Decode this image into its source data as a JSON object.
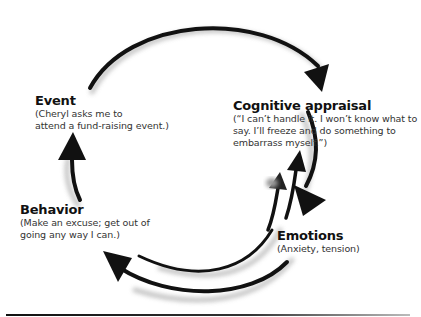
{
  "nodes": {
    "event": {
      "title": "Event",
      "desc_line1": "(Cheryl asks me to",
      "desc_line2": "attend a fund-raising event.)"
    },
    "cognitive": {
      "title": "Cognitive appraisal",
      "desc_line1": "(“I can’t handle it. I won’t know what to",
      "desc_line2": "say. I’ll freeze and do something to",
      "desc_line3": "embarrass myself.”)"
    },
    "behavior": {
      "title": "Behavior",
      "desc_line1": "(Make an excuse; get out of",
      "desc_line2": "going any way I can.)"
    },
    "emotions": {
      "title": "Emotions",
      "desc_line1": "(Anxiety, tension)"
    }
  },
  "arrows": [
    {
      "from": "Event",
      "to": "Cognitive appraisal"
    },
    {
      "from": "Cognitive appraisal",
      "to": "Emotions"
    },
    {
      "from": "Emotions",
      "to": "Cognitive appraisal"
    },
    {
      "from": "Behavior",
      "to": "Cognitive appraisal"
    },
    {
      "from": "Emotions",
      "to": "Behavior"
    },
    {
      "from": "Emotions",
      "to": "Behavior"
    },
    {
      "from": "Behavior",
      "to": "Event"
    }
  ],
  "colors": {
    "arrow": "#111111",
    "shadow": "#bdbdbd"
  }
}
